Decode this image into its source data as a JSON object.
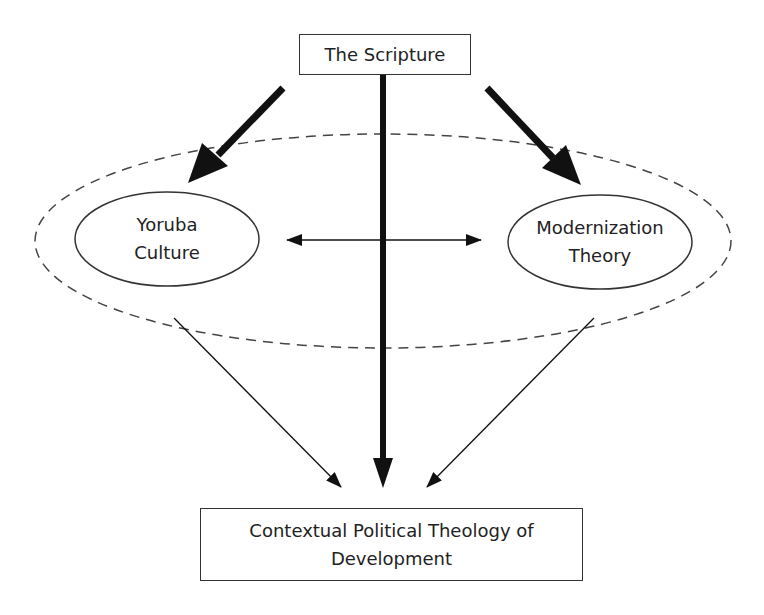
{
  "diagram": {
    "nodes": {
      "scripture": {
        "label": "The Scripture"
      },
      "yoruba": {
        "line1": "Yoruba",
        "line2": "Culture"
      },
      "modernization": {
        "line1": "Modernization",
        "line2": "Theory"
      },
      "outcome": {
        "line1": "Contextual Political Theology of",
        "line2": "Development"
      }
    },
    "edges": [
      {
        "from": "The Scripture",
        "to": "Yoruba Culture",
        "style": "thick"
      },
      {
        "from": "The Scripture",
        "to": "Modernization Theory",
        "style": "thick"
      },
      {
        "from": "The Scripture",
        "to": "Contextual Political Theology of Development",
        "style": "thick"
      },
      {
        "from": "Yoruba Culture",
        "to": "Modernization Theory",
        "style": "thin-bidirectional"
      },
      {
        "from": "Yoruba Culture",
        "to": "Contextual Political Theology of Development",
        "style": "thin"
      },
      {
        "from": "Modernization Theory",
        "to": "Contextual Political Theology of Development",
        "style": "thin"
      }
    ],
    "group": {
      "style": "dashed-ellipse",
      "contains": [
        "Yoruba Culture",
        "Modernization Theory"
      ]
    },
    "colors": {
      "stroke": "#111111",
      "dash": "#444444",
      "text": "#222222",
      "background": "#ffffff"
    }
  }
}
